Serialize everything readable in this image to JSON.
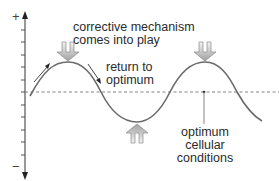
{
  "diagram": {
    "type": "homeostasis-feedback-curve",
    "axis": {
      "plus_label": "+",
      "minus_label": "−"
    },
    "labels": {
      "corrective_line1": "corrective mechanism",
      "corrective_line2": "comes into play",
      "return_line1": "return to",
      "return_line2": "optimum",
      "optimum_line1": "optimum",
      "optimum_line2": "cellular",
      "optimum_line3": "conditions"
    },
    "icons": [
      "down-arrow-icon",
      "down-arrow-icon",
      "up-arrow-icon",
      "rising-arrow-icon",
      "falling-arrow-icon"
    ],
    "colors": {
      "curve": "#6b6b6b",
      "axis": "#333333",
      "baseline": "#777777",
      "arrow_fill_top": "#f2f2f2",
      "arrow_fill_bottom": "#a8a8a8",
      "text": "#2b2b2b"
    }
  }
}
